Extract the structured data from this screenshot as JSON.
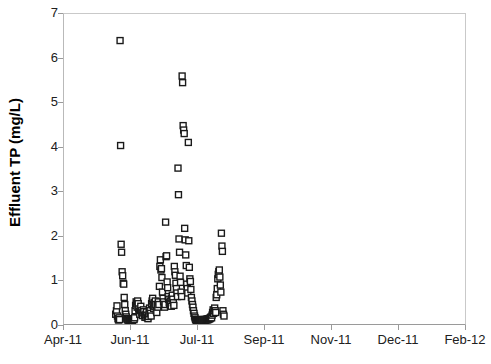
{
  "chart_data": {
    "type": "scatter",
    "title": "",
    "xlabel": "",
    "ylabel": "Effluent TP (mg/L)",
    "ylim": [
      0,
      7
    ],
    "yticks": [
      0,
      1,
      2,
      3,
      4,
      5,
      6,
      7
    ],
    "ytick_labels": [
      "0",
      "1",
      "2",
      "3",
      "4",
      "5",
      "6",
      "7"
    ],
    "xtick_labels": [
      "Apr-11",
      "Jun-11",
      "Jul-11",
      "Sep-11",
      "Nov-11",
      "Dec-11",
      "Feb-12"
    ],
    "xlim_labels": [
      "Apr-11",
      "Feb-12"
    ],
    "grid": false,
    "legend": false,
    "marker": "open-square",
    "marker_color": "#ffffff",
    "marker_edge_color": "#1a1a1a",
    "series": [
      {
        "name": "Effluent TP",
        "points": [
          [
            0.775,
            0.22
          ],
          [
            0.787,
            0.3
          ],
          [
            0.795,
            0.41
          ],
          [
            0.802,
            0.18
          ],
          [
            0.81,
            0.12
          ],
          [
            0.818,
            0.09
          ],
          [
            0.826,
            0.14
          ],
          [
            0.833,
            0.1
          ],
          [
            0.841,
            6.4
          ],
          [
            0.849,
            4.03
          ],
          [
            0.857,
            1.8
          ],
          [
            0.864,
            1.62
          ],
          [
            0.872,
            1.18
          ],
          [
            0.88,
            1.09
          ],
          [
            0.888,
            0.92
          ],
          [
            0.896,
            0.9
          ],
          [
            0.903,
            0.6
          ],
          [
            0.911,
            0.44
          ],
          [
            0.919,
            0.3
          ],
          [
            0.927,
            0.22
          ],
          [
            0.934,
            0.16
          ],
          [
            0.942,
            0.12
          ],
          [
            0.95,
            0.1
          ],
          [
            0.958,
            0.09
          ],
          [
            0.965,
            0.11
          ],
          [
            0.973,
            0.08
          ],
          [
            0.981,
            0.09
          ],
          [
            0.989,
            0.07
          ],
          [
            0.997,
            0.08
          ],
          [
            1.004,
            0.09
          ],
          [
            1.012,
            0.1
          ],
          [
            1.02,
            0.09
          ],
          [
            1.028,
            0.08
          ],
          [
            1.035,
            0.11
          ],
          [
            1.043,
            0.12
          ],
          [
            1.051,
            0.1
          ],
          [
            1.059,
            0.14
          ],
          [
            1.066,
            0.3
          ],
          [
            1.074,
            0.42
          ],
          [
            1.082,
            0.5
          ],
          [
            1.09,
            0.46
          ],
          [
            1.097,
            0.38
          ],
          [
            1.105,
            0.52
          ],
          [
            1.113,
            0.46
          ],
          [
            1.121,
            0.34
          ],
          [
            1.128,
            0.28
          ],
          [
            1.136,
            0.22
          ],
          [
            1.144,
            0.31
          ],
          [
            1.152,
            0.4
          ],
          [
            1.159,
            0.3
          ],
          [
            1.167,
            0.25
          ],
          [
            1.175,
            0.19
          ],
          [
            1.183,
            0.25
          ],
          [
            1.19,
            0.32
          ],
          [
            1.198,
            0.28
          ],
          [
            1.206,
            0.2
          ],
          [
            1.214,
            0.15
          ],
          [
            1.221,
            0.18
          ],
          [
            1.229,
            0.22
          ],
          [
            1.237,
            0.27
          ],
          [
            1.245,
            0.2
          ],
          [
            1.252,
            0.14
          ],
          [
            1.26,
            0.12
          ],
          [
            1.268,
            0.17
          ],
          [
            1.276,
            0.23
          ],
          [
            1.283,
            0.36
          ],
          [
            1.291,
            0.3
          ],
          [
            1.299,
            0.24
          ],
          [
            1.307,
            0.18
          ],
          [
            1.314,
            0.46
          ],
          [
            1.322,
            0.52
          ],
          [
            1.33,
            0.58
          ],
          [
            1.338,
            0.42
          ],
          [
            1.345,
            0.35
          ],
          [
            1.353,
            0.48
          ],
          [
            1.361,
            0.4
          ],
          [
            1.369,
            0.52
          ],
          [
            1.376,
            0.44
          ],
          [
            1.384,
            0.3
          ],
          [
            1.392,
            0.26
          ],
          [
            1.4,
            0.44
          ],
          [
            1.407,
            0.38
          ],
          [
            1.415,
            0.5
          ],
          [
            1.423,
            0.44
          ],
          [
            1.431,
            0.85
          ],
          [
            1.438,
            1.3
          ],
          [
            1.446,
            1.45
          ],
          [
            1.454,
            1.22
          ],
          [
            1.462,
            1.25
          ],
          [
            1.469,
            1.05
          ],
          [
            1.477,
            0.72
          ],
          [
            1.485,
            0.58
          ],
          [
            1.493,
            0.5
          ],
          [
            1.5,
            0.44
          ],
          [
            1.508,
            0.38
          ],
          [
            1.516,
            0.44
          ],
          [
            1.524,
            2.3
          ],
          [
            1.531,
            1.52
          ],
          [
            1.539,
            1.54
          ],
          [
            1.547,
            0.95
          ],
          [
            1.555,
            0.82
          ],
          [
            1.562,
            0.62
          ],
          [
            1.57,
            0.56
          ],
          [
            1.578,
            0.48
          ],
          [
            1.586,
            0.44
          ],
          [
            1.593,
            0.52
          ],
          [
            1.601,
            0.46
          ],
          [
            1.609,
            0.4
          ],
          [
            1.617,
            0.58
          ],
          [
            1.624,
            0.65
          ],
          [
            1.632,
            0.56
          ],
          [
            1.64,
            0.48
          ],
          [
            1.648,
            0.42
          ],
          [
            1.655,
            1.3
          ],
          [
            1.663,
            1.18
          ],
          [
            1.671,
            1.1
          ],
          [
            1.679,
            0.92
          ],
          [
            1.686,
            0.8
          ],
          [
            1.694,
            0.7
          ],
          [
            1.702,
            0.62
          ],
          [
            1.71,
            3.52
          ],
          [
            1.717,
            2.92
          ],
          [
            1.725,
            1.92
          ],
          [
            1.733,
            1.62
          ],
          [
            1.741,
            1.08
          ],
          [
            1.748,
            0.94
          ],
          [
            1.756,
            0.72
          ],
          [
            1.764,
            0.62
          ],
          [
            1.772,
            5.6
          ],
          [
            1.779,
            5.45
          ],
          [
            1.787,
            4.48
          ],
          [
            1.795,
            4.38
          ],
          [
            1.803,
            4.3
          ],
          [
            1.81,
            2.16
          ],
          [
            1.818,
            1.9
          ],
          [
            1.826,
            1.56
          ],
          [
            1.834,
            1.32
          ],
          [
            1.841,
            0.9
          ],
          [
            1.849,
            0.8
          ],
          [
            1.857,
            0.7
          ],
          [
            1.865,
            4.1
          ],
          [
            1.872,
            1.88
          ],
          [
            1.88,
            1.28
          ],
          [
            1.888,
            1.02
          ],
          [
            1.896,
            0.96
          ],
          [
            1.903,
            0.78
          ],
          [
            1.911,
            0.6
          ],
          [
            1.919,
            0.52
          ],
          [
            1.927,
            0.44
          ],
          [
            1.934,
            0.38
          ],
          [
            1.942,
            0.3
          ],
          [
            1.95,
            0.24
          ],
          [
            1.958,
            0.18
          ],
          [
            1.965,
            0.14
          ],
          [
            1.973,
            0.1
          ],
          [
            1.981,
            0.09
          ],
          [
            1.989,
            0.08
          ],
          [
            1.997,
            0.07
          ],
          [
            2.004,
            0.08
          ],
          [
            2.012,
            0.09
          ],
          [
            2.02,
            0.1
          ],
          [
            2.028,
            0.08
          ],
          [
            2.035,
            0.07
          ],
          [
            2.043,
            0.09
          ],
          [
            2.051,
            0.1
          ],
          [
            2.059,
            0.08
          ],
          [
            2.066,
            0.07
          ],
          [
            2.074,
            0.09
          ],
          [
            2.082,
            0.1
          ],
          [
            2.09,
            0.08
          ],
          [
            2.097,
            0.09
          ],
          [
            2.105,
            0.1
          ],
          [
            2.113,
            0.08
          ],
          [
            2.121,
            0.09
          ],
          [
            2.128,
            0.1
          ],
          [
            2.136,
            0.11
          ],
          [
            2.144,
            0.09
          ],
          [
            2.152,
            0.1
          ],
          [
            2.159,
            0.12
          ],
          [
            2.167,
            0.1
          ],
          [
            2.175,
            0.11
          ],
          [
            2.183,
            0.13
          ],
          [
            2.19,
            0.12
          ],
          [
            2.198,
            0.14
          ],
          [
            2.206,
            0.16
          ],
          [
            2.214,
            0.14
          ],
          [
            2.221,
            0.2
          ],
          [
            2.229,
            0.26
          ],
          [
            2.237,
            0.32
          ],
          [
            2.245,
            0.24
          ],
          [
            2.252,
            0.3
          ],
          [
            2.26,
            0.36
          ],
          [
            2.268,
            0.3
          ],
          [
            2.276,
            0.26
          ],
          [
            2.283,
            0.6
          ],
          [
            2.291,
            0.66
          ],
          [
            2.299,
            0.8
          ],
          [
            2.307,
            1.02
          ],
          [
            2.314,
            1.12
          ],
          [
            2.322,
            1.18
          ],
          [
            2.33,
            1.22
          ],
          [
            2.338,
            1.06
          ],
          [
            2.345,
            0.88
          ],
          [
            2.353,
            0.72
          ],
          [
            2.361,
            2.05
          ],
          [
            2.369,
            1.76
          ],
          [
            2.376,
            1.64
          ],
          [
            2.384,
            0.3
          ],
          [
            2.392,
            0.22
          ],
          [
            2.4,
            0.18
          ]
        ]
      }
    ]
  },
  "axis": {
    "y_title": "Effluent TP (mg/L)"
  }
}
